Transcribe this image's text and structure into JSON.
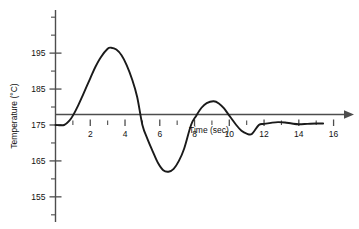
{
  "chart_data": {
    "type": "line",
    "title": "",
    "xlabel": "Time (sec)",
    "ylabel": "Temperature (°C)",
    "xlim": [
      0,
      16.6
    ],
    "ylim": [
      148,
      207
    ],
    "grid": false,
    "legend": null,
    "x_ticks_labeled": [
      2,
      4,
      6,
      8,
      10,
      12,
      14,
      16
    ],
    "x_tick_labels": [
      "2",
      "4",
      "6",
      "8",
      "10",
      "12",
      "14",
      "16"
    ],
    "x_ticks_minor": [
      1,
      3,
      5,
      7,
      9,
      11,
      13,
      15
    ],
    "y_ticks_labeled": [
      155,
      165,
      175,
      185,
      195
    ],
    "y_tick_labels": [
      "155",
      "165",
      "175",
      "185",
      "195"
    ],
    "y_ticks_minor": [
      150,
      160,
      170,
      180,
      190,
      200,
      205
    ],
    "baseline_value": 175,
    "series": [
      {
        "name": "Temperature response",
        "x": [
          0.0,
          0.5,
          0.8,
          1.0,
          1.3,
          1.6,
          2.0,
          2.3,
          2.6,
          3.0,
          3.2,
          3.5,
          3.8,
          4.1,
          4.4,
          4.7,
          5.0,
          5.3,
          5.6,
          5.9,
          6.2,
          6.5,
          6.8,
          7.1,
          7.4,
          7.8,
          8.1,
          8.4,
          8.7,
          9.1,
          9.4,
          9.7,
          10.0,
          10.4,
          10.7,
          11.0,
          11.3,
          11.7,
          12.0,
          12.4,
          12.8,
          13.2,
          13.6,
          14.0,
          14.5,
          15.0,
          15.4
        ],
        "y": [
          175.0,
          175.0,
          176.2,
          177.6,
          180.4,
          183.6,
          188.0,
          191.2,
          193.8,
          196.2,
          196.5,
          196.0,
          194.4,
          191.6,
          187.8,
          182.8,
          175.0,
          171.0,
          167.6,
          164.4,
          162.4,
          162.0,
          162.8,
          165.0,
          168.4,
          175.0,
          177.6,
          179.8,
          181.1,
          181.6,
          181.0,
          179.6,
          177.6,
          175.0,
          173.4,
          172.6,
          172.5,
          175.0,
          175.3,
          175.6,
          175.8,
          175.7,
          175.4,
          175.2,
          175.3,
          175.4,
          175.4
        ]
      }
    ]
  },
  "axes": {
    "y_axis_label": "Temperature (°C)",
    "x_axis_label": "Time (sec)"
  }
}
